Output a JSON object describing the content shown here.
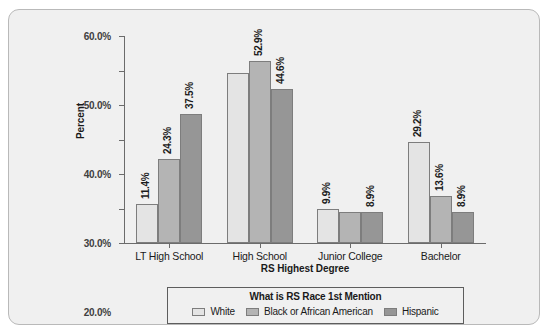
{
  "clipped_top_text": "",
  "chart_data": {
    "type": "bar",
    "title": "",
    "xlabel": "RS Highest Degree",
    "ylabel": "Percent",
    "categories": [
      "LT High School",
      "High School",
      "Junior College",
      "Bachelor"
    ],
    "series": [
      {
        "name": "White",
        "color": "#e4e4e4",
        "values": [
          11.4,
          49.4,
          9.9,
          29.2
        ],
        "labels": [
          "11.4%",
          "",
          "9.9%",
          "29.2%"
        ]
      },
      {
        "name": "Black or African American",
        "color": "#b4b4b4",
        "values": [
          24.3,
          52.9,
          9.1,
          13.6
        ],
        "labels": [
          "24.3%",
          "52.9%",
          "",
          "13.6%"
        ]
      },
      {
        "name": "Hispanic",
        "color": "#969696",
        "values": [
          37.5,
          44.6,
          8.9,
          8.9
        ],
        "labels": [
          "37.5%",
          "44.6%",
          "8.9%",
          "8.9%"
        ]
      }
    ],
    "ylim": [
      0,
      60
    ],
    "ytick_values": [
      0,
      10,
      20,
      30,
      40,
      50,
      60
    ],
    "ytick_labels": [
      "0.0%",
      "10.0%",
      "20.0%",
      "30.0%",
      "40.0%",
      "50.0%",
      "60.0%"
    ],
    "grid": false,
    "legend_position": "bottom",
    "legend_title": "What is RS Race 1st Mention"
  },
  "colors": {
    "panel_background": "#f0f0f0",
    "panel_border": "#b9b9b9",
    "axis": "#6b6b6b",
    "text": "#1a1a1a",
    "bar_border": "#7d7d7d"
  }
}
